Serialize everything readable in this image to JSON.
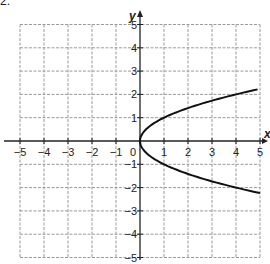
{
  "problem_label": "2.",
  "chart_data": {
    "type": "line",
    "title": "",
    "xlabel": "x",
    "ylabel": "y",
    "xlim": [
      -5,
      5
    ],
    "ylim": [
      -5,
      5
    ],
    "grid": true,
    "x_ticks": [
      -5,
      -4,
      -3,
      -2,
      -1,
      1,
      2,
      3,
      4,
      5
    ],
    "y_ticks": [
      -5,
      -4,
      -3,
      -2,
      -1,
      1,
      2,
      3,
      4,
      5
    ],
    "origin_label": "0",
    "series": [
      {
        "name": "x = y^2",
        "x": [
          5,
          4,
          3,
          2,
          1,
          0.5,
          0.25,
          0,
          0.25,
          0.5,
          1,
          2,
          3,
          4,
          5
        ],
        "y": [
          2.24,
          2,
          1.73,
          1.41,
          1,
          0.71,
          0.5,
          0,
          -0.5,
          -0.71,
          -1,
          -1.41,
          -1.73,
          -2,
          -2.24
        ],
        "color": "#111111"
      }
    ]
  }
}
